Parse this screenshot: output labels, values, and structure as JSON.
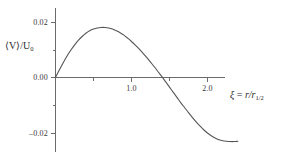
{
  "chart_data": {
    "type": "line",
    "title": "",
    "subtitle": "",
    "xlabel": "ξ = r/r₁₂",
    "ylabel": "⟨V⟩/U₀",
    "xlim": [
      0,
      2.4
    ],
    "ylim": [
      -0.025,
      0.024
    ],
    "grid": false,
    "legend": null,
    "x_ticks": [
      {
        "value": 1.0,
        "label": "1.0",
        "labeled": true
      },
      {
        "value": 2.0,
        "label": "2.0",
        "labeled": true
      },
      {
        "value": 0.5,
        "label": "",
        "labeled": false
      },
      {
        "value": 1.5,
        "label": "",
        "labeled": false
      }
    ],
    "y_ticks": [
      {
        "value": 0.02,
        "label": "0.02",
        "labeled": true
      },
      {
        "value": 0.01,
        "label": "",
        "labeled": false
      },
      {
        "value": 0.0,
        "label": "0.00",
        "labeled": true
      },
      {
        "value": -0.01,
        "label": "",
        "labeled": false
      },
      {
        "value": -0.02,
        "label": "–0.02",
        "labeled": true
      }
    ],
    "series": [
      {
        "name": "mean radial velocity",
        "color": "#555555",
        "x": [
          0.0,
          0.05,
          0.1,
          0.15,
          0.2,
          0.25,
          0.3,
          0.35,
          0.4,
          0.45,
          0.5,
          0.55,
          0.6,
          0.65,
          0.7,
          0.75,
          0.8,
          0.85,
          0.9,
          0.95,
          1.0,
          1.05,
          1.1,
          1.15,
          1.2,
          1.25,
          1.3,
          1.35,
          1.4,
          1.45,
          1.5,
          1.55,
          1.6,
          1.65,
          1.7,
          1.75,
          1.8,
          1.85,
          1.9,
          1.95,
          2.0,
          2.05,
          2.1,
          2.15,
          2.2,
          2.25,
          2.3,
          2.35,
          2.4
        ],
        "y": [
          0.0,
          0.0027,
          0.0053,
          0.0077,
          0.0099,
          0.0118,
          0.0135,
          0.0149,
          0.0161,
          0.017,
          0.0176,
          0.018,
          0.0182,
          0.0182,
          0.018,
          0.0176,
          0.017,
          0.0163,
          0.0154,
          0.0143,
          0.0131,
          0.0118,
          0.0104,
          0.0089,
          0.0073,
          0.0056,
          0.0039,
          0.0021,
          0.0003,
          -0.0016,
          -0.0035,
          -0.0054,
          -0.0073,
          -0.0092,
          -0.011,
          -0.0128,
          -0.0145,
          -0.0161,
          -0.0176,
          -0.019,
          -0.0202,
          -0.0212,
          -0.022,
          -0.0226,
          -0.023,
          -0.0232,
          -0.0233,
          -0.0233,
          -0.0232
        ]
      }
    ],
    "annotations": {
      "peak_value": 0.0182,
      "peak_position": 0.63,
      "zero_crossing": 1.41,
      "end_value": -0.0232
    }
  },
  "labels": {
    "y_axis_title_prefix": "⟨V⟩/U",
    "y_axis_title_sub": "0",
    "x_axis_title_var": "ξ",
    "x_axis_title_eq": " = ",
    "x_axis_title_num": "r/r",
    "x_axis_title_sub": "1/2"
  }
}
